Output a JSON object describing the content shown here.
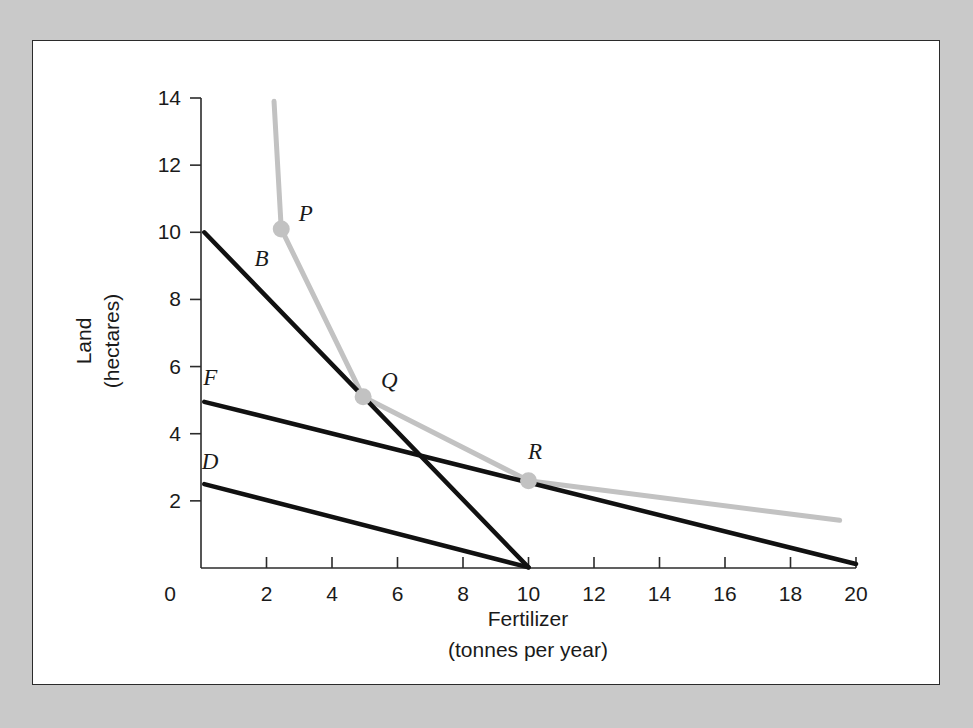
{
  "chart_data": {
    "type": "line",
    "title": "",
    "xlabel": "Fertilizer",
    "xlabel_sub": "(tonnes per year)",
    "ylabel": "Land",
    "ylabel_sub": "(hectares)",
    "xlim": [
      0,
      20
    ],
    "ylim": [
      0,
      14
    ],
    "xticks": [
      0,
      2,
      4,
      6,
      8,
      10,
      12,
      14,
      16,
      18,
      20
    ],
    "xtick_labels": [
      "0",
      "2",
      "4",
      "6",
      "8",
      "10",
      "12",
      "14",
      "16",
      "18",
      "20"
    ],
    "yticks": [
      2,
      4,
      6,
      8,
      10,
      12,
      14
    ],
    "ytick_labels": [
      "2",
      "4",
      "6",
      "8",
      "10",
      "12",
      "14"
    ],
    "grid": false,
    "legend": "none",
    "series": [
      {
        "name": "isoquant",
        "label": "",
        "color": "#c2c2c2",
        "style": "curve",
        "points": [
          [
            2.23,
            13.9
          ],
          [
            2.45,
            10.1
          ],
          [
            4.95,
            5.1
          ],
          [
            10.0,
            2.6
          ],
          [
            19.5,
            1.42
          ]
        ]
      },
      {
        "name": "B",
        "label": "B",
        "color": "#111111",
        "style": "line",
        "points": [
          [
            0.1,
            10.0
          ],
          [
            10.0,
            0.02
          ]
        ]
      },
      {
        "name": "F",
        "label": "F",
        "color": "#111111",
        "style": "line",
        "points": [
          [
            0.1,
            4.95
          ],
          [
            20.0,
            0.12
          ]
        ]
      },
      {
        "name": "D",
        "label": "D",
        "color": "#111111",
        "style": "line",
        "points": [
          [
            0.1,
            2.5
          ],
          [
            10.0,
            0.02
          ]
        ]
      }
    ],
    "markers": [
      {
        "label": "P",
        "x": 2.45,
        "y": 10.1
      },
      {
        "label": "Q",
        "x": 4.95,
        "y": 5.1
      },
      {
        "label": "R",
        "x": 10.0,
        "y": 2.6
      }
    ],
    "curve_labels": [
      {
        "label": "B",
        "x": 1.85,
        "y": 9.0
      },
      {
        "label": "F",
        "x": 0.28,
        "y": 5.45
      },
      {
        "label": "D",
        "x": 0.28,
        "y": 2.95
      }
    ],
    "marker_labels": [
      {
        "label": "P",
        "x": 3.2,
        "y": 10.35
      },
      {
        "label": "Q",
        "x": 5.75,
        "y": 5.35
      },
      {
        "label": "R",
        "x": 10.2,
        "y": 3.25
      }
    ]
  },
  "colors": {
    "page_background": "#c9c9c9",
    "panel_background": "#ffffff",
    "panel_border": "#2b2b2b",
    "axis": "#2b2b2b",
    "isoquant": "#c2c2c2",
    "budget_line": "#111111",
    "text": "#1a1a1a"
  }
}
